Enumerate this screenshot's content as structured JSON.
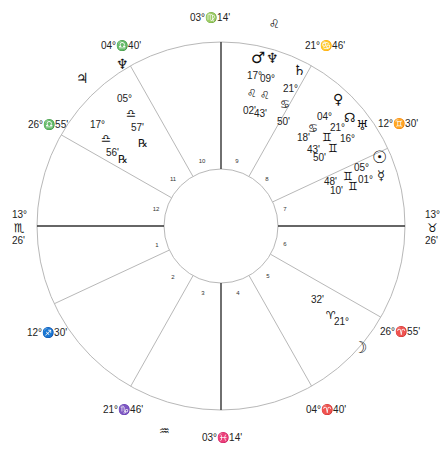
{
  "chart": {
    "center": {
      "x": 221,
      "y": 226
    },
    "outer_radius": 184,
    "inner_radius": 57,
    "line_color": "#b8b8b8",
    "axis_color": "#333333"
  },
  "cusps": [
    {
      "house": 1,
      "angle": 180,
      "label": "13° ♏ 26'",
      "axis": true
    },
    {
      "house": 2,
      "angle": 205,
      "label": "12° ♐ 30'"
    },
    {
      "house": 3,
      "angle": 240.6,
      "label": "21° ♑ 46'"
    },
    {
      "house": 4,
      "angle": 270,
      "label": "03° ♓ 14'",
      "axis": true
    },
    {
      "house": 5,
      "angle": 299.5,
      "label": "04° ♈ 40'"
    },
    {
      "house": 6,
      "angle": 330.3,
      "label": "26° ♈ 55'"
    },
    {
      "house": 7,
      "angle": 0,
      "label": "13° ♉ 26'",
      "axis": true
    },
    {
      "house": 8,
      "angle": 25,
      "label": "12° ♊ 30'"
    },
    {
      "house": 9,
      "angle": 60.6,
      "label": "21° ♋ 46'"
    },
    {
      "house": 10,
      "angle": 90,
      "label": "03° ♍ 14'",
      "axis": true
    },
    {
      "house": 11,
      "angle": 119.5,
      "label": "04° ♎ 40'"
    },
    {
      "house": 12,
      "angle": 150.3,
      "label": "26° ♎ 55'"
    }
  ],
  "cusp_labels": [
    {
      "text": "03°♍14'",
      "x": 190,
      "y": 21
    },
    {
      "text": "21°♋46'",
      "x": 305,
      "y": 49
    },
    {
      "text": "12°♊30'",
      "x": 378,
      "y": 127
    },
    {
      "text": "04°♎40'",
      "x": 101,
      "y": 49
    },
    {
      "text": "26°♎55'",
      "x": 28,
      "y": 128
    },
    {
      "text": "12°♐30'",
      "x": 27,
      "y": 336
    },
    {
      "text": "21°♑46'",
      "x": 103,
      "y": 413
    },
    {
      "text": "04°♈40'",
      "x": 306,
      "y": 413
    },
    {
      "text": "26°♈55'",
      "x": 380,
      "y": 335
    },
    {
      "text": "03°♓14'",
      "x": 202,
      "y": 441
    }
  ],
  "asc_label": {
    "deg": "13°",
    "sign": "♏",
    "min": "26'"
  },
  "dsc_label": {
    "deg": "13°",
    "sign": "♉",
    "min": "26'"
  },
  "intercepted": [
    {
      "sign": "♌",
      "name": "leo",
      "x": 269,
      "y": 28
    },
    {
      "sign": "♒",
      "name": "aquarius",
      "x": 159,
      "y": 435
    }
  ],
  "house_numbers": [
    {
      "n": "1",
      "x": 157,
      "y": 247
    },
    {
      "n": "2",
      "x": 173,
      "y": 279
    },
    {
      "n": "3",
      "x": 203,
      "y": 295
    },
    {
      "n": "4",
      "x": 238,
      "y": 295
    },
    {
      "n": "5",
      "x": 268,
      "y": 278
    },
    {
      "n": "6",
      "x": 285,
      "y": 246
    },
    {
      "n": "7",
      "x": 285,
      "y": 211
    },
    {
      "n": "8",
      "x": 267,
      "y": 181
    },
    {
      "n": "9",
      "x": 237,
      "y": 163
    },
    {
      "n": "10",
      "x": 202,
      "y": 163
    },
    {
      "n": "11",
      "x": 173,
      "y": 181
    },
    {
      "n": "12",
      "x": 156,
      "y": 211
    }
  ],
  "planets": [
    {
      "name": "mars",
      "glyph": "♂",
      "x": 251,
      "y": 63,
      "size": 16
    },
    {
      "name": "neptune-9",
      "glyph": "♆",
      "x": 266,
      "y": 63,
      "size": 14
    },
    {
      "name": "saturn",
      "glyph": "♄",
      "x": 293,
      "y": 75,
      "size": 14
    },
    {
      "name": "neptune",
      "glyph": "♆",
      "x": 116,
      "y": 69,
      "size": 14
    },
    {
      "name": "jupiter",
      "glyph": "♃",
      "x": 76,
      "y": 83,
      "size": 14
    },
    {
      "name": "venus",
      "glyph": "♀",
      "x": 333,
      "y": 104,
      "size": 14
    },
    {
      "name": "north-node",
      "glyph": "☊",
      "x": 344,
      "y": 122,
      "size": 13
    },
    {
      "name": "uranus",
      "glyph": "♅",
      "x": 356,
      "y": 130,
      "size": 14
    },
    {
      "name": "sun",
      "glyph": "☉",
      "x": 372,
      "y": 163,
      "size": 17
    },
    {
      "name": "mercury",
      "glyph": "☿",
      "x": 377,
      "y": 180,
      "size": 13
    },
    {
      "name": "moon",
      "glyph": "☽",
      "x": 353,
      "y": 353,
      "size": 16
    }
  ],
  "planet_texts": [
    {
      "text": "17°",
      "x": 247,
      "y": 79
    },
    {
      "text": "09°",
      "x": 260,
      "y": 82
    },
    {
      "text": "♌",
      "x": 247,
      "y": 97,
      "glyph": true
    },
    {
      "text": "♌",
      "x": 260,
      "y": 99,
      "glyph": true
    },
    {
      "text": "02'",
      "x": 243,
      "y": 114
    },
    {
      "text": "43'",
      "x": 254,
      "y": 117
    },
    {
      "text": "21°",
      "x": 283,
      "y": 92
    },
    {
      "text": "♋",
      "x": 280,
      "y": 108,
      "glyph": true
    },
    {
      "text": "50'",
      "x": 277,
      "y": 125
    },
    {
      "text": "05°",
      "x": 117,
      "y": 102
    },
    {
      "text": "♎",
      "x": 126,
      "y": 117,
      "glyph": true
    },
    {
      "text": "57'",
      "x": 131,
      "y": 131
    },
    {
      "text": "℞",
      "x": 138,
      "y": 147,
      "glyph": true
    },
    {
      "text": "17°",
      "x": 90,
      "y": 128
    },
    {
      "text": "♎",
      "x": 101,
      "y": 142,
      "glyph": true
    },
    {
      "text": "56'",
      "x": 106,
      "y": 156
    },
    {
      "text": "℞",
      "x": 118,
      "y": 163,
      "glyph": true
    },
    {
      "text": "04°",
      "x": 317,
      "y": 120
    },
    {
      "text": "♋",
      "x": 308,
      "y": 132,
      "glyph": true
    },
    {
      "text": "21°",
      "x": 330,
      "y": 131
    },
    {
      "text": "18'",
      "x": 297,
      "y": 141
    },
    {
      "text": "♊",
      "x": 322,
      "y": 141,
      "glyph": true
    },
    {
      "text": "16°",
      "x": 340,
      "y": 142
    },
    {
      "text": "43'",
      "x": 307,
      "y": 153
    },
    {
      "text": "♊",
      "x": 328,
      "y": 152,
      "glyph": true
    },
    {
      "text": "50'",
      "x": 313,
      "y": 161
    },
    {
      "text": "05°",
      "x": 354,
      "y": 171
    },
    {
      "text": "48'",
      "x": 324,
      "y": 185
    },
    {
      "text": "♊",
      "x": 343,
      "y": 180,
      "glyph": true
    },
    {
      "text": "01°",
      "x": 358,
      "y": 183
    },
    {
      "text": "10'",
      "x": 330,
      "y": 194
    },
    {
      "text": "♊",
      "x": 348,
      "y": 190,
      "glyph": true
    },
    {
      "text": "32'",
      "x": 311,
      "y": 303
    },
    {
      "text": "♈",
      "x": 326,
      "y": 319,
      "glyph": true
    },
    {
      "text": "21°",
      "x": 334,
      "y": 325
    }
  ]
}
